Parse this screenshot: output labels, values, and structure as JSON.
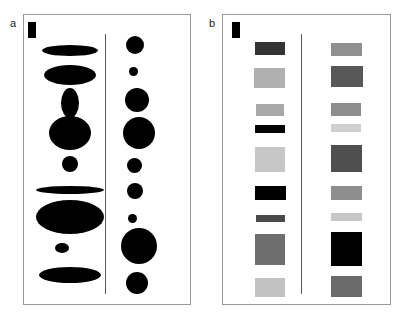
{
  "figure": {
    "title": "",
    "background_color": "#ffffff",
    "width": 402,
    "height": 315
  },
  "panels": [
    {
      "id": "a",
      "label": "a",
      "border_color": "#9a9a9a",
      "scale_bar": {
        "name": "scale-bar",
        "color": "#000000",
        "width": 8,
        "height": 16
      },
      "divider": {
        "color": "#5a5a5a",
        "x": 105
      }
    },
    {
      "id": "b",
      "label": "b",
      "border_color": "#9a9a9a",
      "scale_bar": {
        "name": "scale-bar",
        "color": "#000000",
        "width": 8,
        "height": 16
      },
      "divider": {
        "color": "#5a5a5a",
        "x": 301
      }
    }
  ],
  "chart_data": {
    "type": "scatter",
    "title": "",
    "subtitle": "",
    "xlabel": "",
    "ylabel": "",
    "legend": [],
    "grid": false,
    "panel_a": {
      "encoding": "area-and-shape",
      "fill_color": "#000000",
      "left_column": {
        "name": "ellipse-column-left",
        "items": [
          {
            "index": 1,
            "cx": 70,
            "cy": 50,
            "rx": 28,
            "ry": 5.5
          },
          {
            "index": 2,
            "cx": 70,
            "cy": 75,
            "rx": 26,
            "ry": 10
          },
          {
            "index": 3,
            "cx": 70,
            "cy": 103,
            "rx": 9,
            "ry": 15
          },
          {
            "index": 4,
            "cx": 70,
            "cy": 133,
            "rx": 21,
            "ry": 17
          },
          {
            "index": 5,
            "cx": 70,
            "cy": 164,
            "rx": 8,
            "ry": 8
          },
          {
            "index": 6,
            "cx": 70,
            "cy": 190,
            "rx": 34,
            "ry": 4
          },
          {
            "index": 7,
            "cx": 70,
            "cy": 217,
            "rx": 34,
            "ry": 17
          },
          {
            "index": 8,
            "cx": 62,
            "cy": 248,
            "rx": 7,
            "ry": 5
          },
          {
            "index": 9,
            "cx": 70,
            "cy": 275,
            "rx": 31,
            "ry": 8
          }
        ]
      },
      "right_column": {
        "name": "circle-column-right",
        "items": [
          {
            "index": 1,
            "cx": 135,
            "cy": 45,
            "r": 9
          },
          {
            "index": 2,
            "cx": 133,
            "cy": 71,
            "r": 4.5
          },
          {
            "index": 3,
            "cx": 137,
            "cy": 100,
            "r": 12
          },
          {
            "index": 4,
            "cx": 139,
            "cy": 133,
            "r": 16
          },
          {
            "index": 5,
            "cx": 134,
            "cy": 165,
            "r": 7.5
          },
          {
            "index": 6,
            "cx": 135,
            "cy": 191,
            "r": 8
          },
          {
            "index": 7,
            "cx": 132,
            "cy": 218,
            "r": 4.5
          },
          {
            "index": 8,
            "cx": 139,
            "cy": 246,
            "r": 18
          },
          {
            "index": 9,
            "cx": 137,
            "cy": 283,
            "r": 11
          }
        ]
      }
    },
    "panel_b": {
      "encoding": "area-and-gray-level",
      "left_column": {
        "name": "swatch-column-left",
        "items": [
          {
            "index": 1,
            "x": 255,
            "y": 42,
            "w": 30,
            "h": 13,
            "color": "#333333"
          },
          {
            "index": 2,
            "x": 254,
            "y": 68,
            "w": 31,
            "h": 20,
            "color": "#b0b0b0"
          },
          {
            "index": 3,
            "x": 256,
            "y": 104,
            "w": 28,
            "h": 12,
            "color": "#a8a8a8"
          },
          {
            "index": 4,
            "x": 255,
            "y": 125,
            "w": 30,
            "h": 8,
            "color": "#030303"
          },
          {
            "index": 5,
            "x": 255,
            "y": 147,
            "w": 30,
            "h": 25,
            "color": "#c6c6c6"
          },
          {
            "index": 6,
            "x": 255,
            "y": 186,
            "w": 31,
            "h": 14,
            "color": "#000000"
          },
          {
            "index": 7,
            "x": 256,
            "y": 215,
            "w": 29,
            "h": 7,
            "color": "#4a4a4a"
          },
          {
            "index": 8,
            "x": 255,
            "y": 234,
            "w": 30,
            "h": 31,
            "color": "#6e6e6e"
          },
          {
            "index": 9,
            "x": 255,
            "y": 278,
            "w": 30,
            "h": 19,
            "color": "#c2c2c2"
          }
        ]
      },
      "right_column": {
        "name": "swatch-column-right",
        "items": [
          {
            "index": 1,
            "x": 331,
            "y": 43,
            "w": 31,
            "h": 13,
            "color": "#909090"
          },
          {
            "index": 2,
            "x": 331,
            "y": 66,
            "w": 32,
            "h": 21,
            "color": "#585858"
          },
          {
            "index": 3,
            "x": 331,
            "y": 103,
            "w": 30,
            "h": 13,
            "color": "#8d8d8d"
          },
          {
            "index": 4,
            "x": 331,
            "y": 124,
            "w": 30,
            "h": 8,
            "color": "#cfcfcf"
          },
          {
            "index": 5,
            "x": 331,
            "y": 145,
            "w": 31,
            "h": 27,
            "color": "#4f4f4f"
          },
          {
            "index": 6,
            "x": 331,
            "y": 186,
            "w": 31,
            "h": 14,
            "color": "#8e8e8e"
          },
          {
            "index": 7,
            "x": 331,
            "y": 213,
            "w": 31,
            "h": 8,
            "color": "#c6c6c6"
          },
          {
            "index": 8,
            "x": 331,
            "y": 232,
            "w": 31,
            "h": 34,
            "color": "#000000"
          },
          {
            "index": 9,
            "x": 331,
            "y": 276,
            "w": 31,
            "h": 21,
            "color": "#6b6b6b"
          }
        ]
      }
    }
  }
}
